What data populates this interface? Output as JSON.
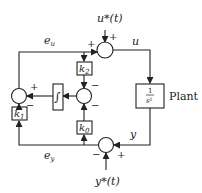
{
  "diagram": {
    "type": "block-diagram",
    "signals": {
      "u_ref": "u*(t)",
      "u": "u",
      "e_u": "e",
      "e_u_sub": "u",
      "y": "y",
      "e_y": "e",
      "e_y_sub": "y",
      "y_ref": "y*(t)"
    },
    "blocks": {
      "plant_num": "1",
      "plant_den": "s²",
      "plant_label": "Plant",
      "integrator": "∫",
      "k0": "k",
      "k0_sub": "0",
      "k1": "k",
      "k1_sub": "1",
      "k2": "k",
      "k2_sub": "2"
    },
    "signs": {
      "top_sum_left": "+",
      "top_sum_top": "+",
      "mid_sum_top": "−",
      "mid_sum_bottom": "−",
      "left_sum_top": "+",
      "left_sum_bottom": "−",
      "bot_sum_right": "+",
      "bot_sum_left": "−"
    },
    "colors": {
      "stroke": "#222222",
      "background": "#ffffff"
    }
  }
}
